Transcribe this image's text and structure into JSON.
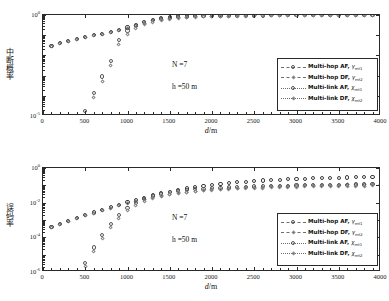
{
  "figure": {
    "axis_title_x": "d/m",
    "panels": [
      {
        "id": "outage",
        "ylabel": "中断概率",
        "annotations": [
          {
            "text": "N =7"
          },
          {
            "text": "h =50 m"
          }
        ],
        "ytick_labels": [
          "10",
          "10"
        ],
        "ytick_exponents": [
          "0",
          "-5"
        ]
      },
      {
        "id": "ber",
        "ylabel": "误码率",
        "annotations": [
          {
            "text": "N =7"
          },
          {
            "text": "h =50 m"
          }
        ],
        "ytick_labels": [
          "10",
          "10",
          "10",
          "10"
        ],
        "ytick_exponents": [
          "0",
          "-2",
          "-4",
          "-6"
        ]
      }
    ],
    "xtick_labels": [
      "0",
      "500",
      "1000",
      "1500",
      "2000",
      "2500",
      "3000",
      "3500",
      "4000"
    ],
    "legend": {
      "entries": [
        {
          "name": "Multi-hop AF",
          "symbol": "γ",
          "subscript": "mt1",
          "marker": "circle",
          "line": "dashdot"
        },
        {
          "name": "Multi-hop DF",
          "symbol": "γ",
          "subscript": "mt2",
          "marker": "diamond",
          "line": "dashed"
        },
        {
          "name": "Multi-link AF",
          "symbol": "χ",
          "subscript": "mt1",
          "marker": "circle",
          "line": "dotted"
        },
        {
          "name": "Multi-link DF",
          "symbol": "χ",
          "subscript": "mt2",
          "marker": "diamond",
          "line": "dotted"
        }
      ]
    }
  },
  "chart_data": [
    {
      "type": "scatter",
      "title": "",
      "xlabel": "d/m",
      "ylabel": "中断概率",
      "xlim": [
        0,
        4000
      ],
      "ylim": [
        1e-05,
        1
      ],
      "yscale": "log",
      "grid": false,
      "legend_position": "lower-right",
      "annotations": [
        "N =7",
        "h =50 m"
      ],
      "x": [
        100,
        200,
        300,
        400,
        500,
        600,
        700,
        800,
        900,
        1000,
        1100,
        1200,
        1300,
        1400,
        1500,
        1600,
        1700,
        1800,
        1900,
        2000,
        2100,
        2200,
        2300,
        2400,
        2500,
        2600,
        2700,
        2800,
        2900,
        3000,
        3100,
        3200,
        3300,
        3400,
        3500,
        3600,
        3700,
        3800,
        3900,
        4000
      ],
      "series": [
        {
          "name": "Multi-hop AF, γmt1",
          "marker": "circle",
          "values": [
            0.03,
            0.041,
            0.053,
            0.066,
            0.081,
            0.098,
            0.118,
            0.142,
            0.175,
            0.24,
            0.33,
            0.45,
            0.58,
            0.7,
            0.82,
            0.88,
            0.915,
            0.935,
            0.95,
            0.96,
            0.967,
            0.972,
            0.976,
            0.979,
            0.982,
            0.984,
            0.986,
            0.988,
            0.989,
            0.99,
            0.991,
            0.992,
            0.993,
            0.993,
            0.994,
            0.994,
            0.995,
            0.995,
            0.996,
            0.996
          ]
        },
        {
          "name": "Multi-hop DF, γmt2",
          "marker": "diamond",
          "values": [
            0.028,
            0.039,
            0.05,
            0.063,
            0.077,
            0.093,
            0.112,
            0.135,
            0.165,
            0.22,
            0.295,
            0.395,
            0.5,
            0.6,
            0.69,
            0.745,
            0.785,
            0.815,
            0.838,
            0.856,
            0.87,
            0.882,
            0.892,
            0.9,
            0.908,
            0.914,
            0.92,
            0.925,
            0.929,
            0.933,
            0.937,
            0.94,
            0.943,
            0.946,
            0.948,
            0.951,
            0.953,
            0.955,
            0.957,
            0.959
          ]
        },
        {
          "name": "Multi-link AF, χmt1",
          "marker": "circle",
          "values": [
            null,
            null,
            null,
            null,
            1.8e-05,
            0.00014,
            0.0009,
            0.0055,
            0.06,
            0.17,
            0.3,
            0.43,
            0.545,
            0.645,
            0.73,
            0.79,
            0.833,
            0.864,
            0.886,
            0.903,
            0.917,
            0.928,
            0.937,
            0.944,
            0.95,
            0.955,
            0.96,
            0.964,
            0.967,
            0.97,
            0.972,
            0.975,
            0.977,
            0.978,
            0.98,
            0.981,
            0.983,
            0.984,
            0.985,
            0.986
          ]
        },
        {
          "name": "Multi-link DF, χmt2",
          "marker": "diamond",
          "values": [
            null,
            null,
            null,
            null,
            1.05e-05,
            8e-05,
            0.00052,
            0.0032,
            0.036,
            0.11,
            0.215,
            0.33,
            0.44,
            0.54,
            0.625,
            0.69,
            0.738,
            0.775,
            0.803,
            0.826,
            0.844,
            0.859,
            0.872,
            0.882,
            0.891,
            0.899,
            0.906,
            0.912,
            0.917,
            0.922,
            0.927,
            0.931,
            0.934,
            0.938,
            0.941,
            0.944,
            0.946,
            0.949,
            0.951,
            0.953
          ]
        }
      ]
    },
    {
      "type": "scatter",
      "title": "",
      "xlabel": "d/m",
      "ylabel": "误码率",
      "xlim": [
        0,
        4000
      ],
      "ylim": [
        1e-06,
        1
      ],
      "yscale": "log",
      "grid": false,
      "legend_position": "lower-right",
      "annotations": [
        "N =7",
        "h =50 m"
      ],
      "x": [
        100,
        200,
        300,
        400,
        500,
        600,
        700,
        800,
        900,
        1000,
        1100,
        1200,
        1300,
        1400,
        1500,
        1600,
        1700,
        1800,
        1900,
        2000,
        2100,
        2200,
        2300,
        2400,
        2500,
        2600,
        2700,
        2800,
        2900,
        3000,
        3100,
        3200,
        3300,
        3400,
        3500,
        3600,
        3700,
        3800,
        3900,
        4000
      ],
      "series": [
        {
          "name": "Multi-hop AF, γmt1",
          "marker": "circle",
          "values": [
            0.0004,
            0.0006,
            0.0009,
            0.0013,
            0.0019,
            0.0027,
            0.0038,
            0.0054,
            0.0076,
            0.0105,
            0.0145,
            0.0195,
            0.026,
            0.034,
            0.043,
            0.054,
            0.066,
            0.079,
            0.093,
            0.107,
            0.122,
            0.136,
            0.15,
            0.164,
            0.178,
            0.19,
            0.202,
            0.213,
            0.224,
            0.234,
            0.243,
            0.252,
            0.26,
            0.268,
            0.275,
            0.282,
            0.288,
            0.294,
            0.3,
            0.305
          ]
        },
        {
          "name": "Multi-hop DF, γmt2",
          "marker": "diamond",
          "values": [
            0.00038,
            0.00056,
            0.00083,
            0.0012,
            0.00172,
            0.00243,
            0.0034,
            0.0047,
            0.0065,
            0.0088,
            0.0117,
            0.0152,
            0.0193,
            0.0238,
            0.0286,
            0.0336,
            0.0386,
            0.0436,
            0.0485,
            0.0532,
            0.0578,
            0.0622,
            0.0664,
            0.0704,
            0.0742,
            0.0778,
            0.0812,
            0.0845,
            0.0876,
            0.0905,
            0.0933,
            0.0959,
            0.0984,
            0.1008,
            0.1031,
            0.1052,
            0.1073,
            0.1092,
            0.1111,
            0.1129
          ]
        },
        {
          "name": "Multi-link AF, χmt1",
          "marker": "circle",
          "values": [
            null,
            null,
            null,
            null,
            3.3e-06,
            2.6e-05,
            0.00014,
            0.00058,
            0.00185,
            0.0047,
            0.0095,
            0.0163,
            0.0243,
            0.0325,
            0.04,
            0.0468,
            0.0528,
            0.0582,
            0.063,
            0.0674,
            0.0714,
            0.0751,
            0.0786,
            0.0818,
            0.0848,
            0.0877,
            0.0903,
            0.0929,
            0.0953,
            0.0976,
            0.0998,
            0.1019,
            0.1039,
            0.1058,
            0.1077,
            0.1095,
            0.1112,
            0.1128,
            0.1144,
            0.116
          ]
        },
        {
          "name": "Multi-link DF, χmt2",
          "marker": "diamond",
          "values": [
            null,
            null,
            null,
            null,
            2e-06,
            1.6e-05,
            8.8e-05,
            0.00037,
            0.00125,
            0.0033,
            0.0069,
            0.0121,
            0.0183,
            0.0247,
            0.0306,
            0.0359,
            0.0407,
            0.045,
            0.0489,
            0.0524,
            0.0557,
            0.0587,
            0.0615,
            0.0641,
            0.0666,
            0.069,
            0.0712,
            0.0733,
            0.0753,
            0.0772,
            0.0791,
            0.0808,
            0.0825,
            0.0841,
            0.0857,
            0.0872,
            0.0886,
            0.09,
            0.0914,
            0.0927
          ]
        }
      ]
    }
  ]
}
